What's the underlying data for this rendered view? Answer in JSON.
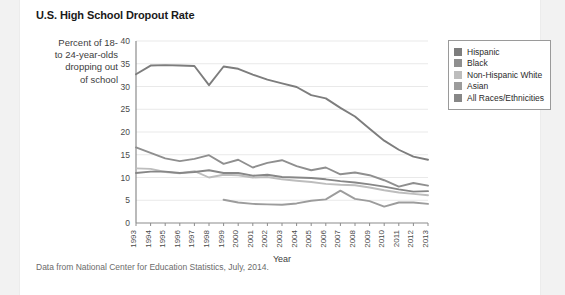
{
  "card": {
    "title": "U.S. High School Dropout Rate",
    "annotation": "Percent of 18- to 24-year-olds dropping out of school",
    "annotation_lines": [
      "Percent of 18-",
      "to 24-year-olds",
      "dropping out",
      "of school"
    ],
    "source": "Data from National Center for Education Statistics, July, 2014."
  },
  "legend": {
    "position": "top-right-inside",
    "items": [
      {
        "label": "Hispanic",
        "color": "#7d7d7d"
      },
      {
        "label": "Black",
        "color": "#8f8f8f"
      },
      {
        "label": "Non-Hispanic White",
        "color": "#bdbdbd"
      },
      {
        "label": "Asian",
        "color": "#9c9c9c"
      },
      {
        "label": "All Races/Ethnicities",
        "color": "#878787"
      }
    ]
  },
  "chart_data": {
    "type": "line",
    "title": "U.S. High School Dropout Rate",
    "subtitle": "Percent of 18- to 24-year-olds dropping out of school",
    "xlabel": "Year",
    "ylabel": "",
    "ylim": [
      0,
      40
    ],
    "yticks": [
      0,
      5,
      10,
      15,
      20,
      25,
      30,
      35,
      40
    ],
    "grid": true,
    "legend_position": "top-right",
    "annotation": "Data from National Center for Education Statistics, July, 2014.",
    "categories": [
      1993,
      1994,
      1995,
      1996,
      1997,
      1998,
      1999,
      2000,
      2001,
      2002,
      2003,
      2004,
      2005,
      2006,
      2007,
      2008,
      2009,
      2010,
      2011,
      2012,
      2013
    ],
    "x": [
      "1993",
      "1994",
      "1995",
      "1996",
      "1997",
      "1998",
      "1999",
      "2000",
      "2001",
      "2002",
      "2003",
      "2004",
      "2005",
      "2006",
      "2007",
      "2008",
      "2009",
      "2010",
      "2011",
      "2012",
      "2013"
    ],
    "series": [
      {
        "name": "Hispanic",
        "color": "#7d7d7d",
        "values": [
          32.7,
          34.6,
          34.7,
          34.6,
          34.5,
          30.3,
          34.4,
          33.9,
          32.6,
          31.5,
          30.7,
          29.9,
          28.1,
          27.4,
          25.3,
          23.4,
          20.7,
          18.1,
          16.1,
          14.6,
          13.9
        ]
      },
      {
        "name": "Black",
        "color": "#8f8f8f",
        "values": [
          16.6,
          15.4,
          14.2,
          13.6,
          14.1,
          14.9,
          13.0,
          13.9,
          12.2,
          13.2,
          13.8,
          12.5,
          11.6,
          12.2,
          10.7,
          11.1,
          10.5,
          9.4,
          8.0,
          8.8,
          8.2
        ]
      },
      {
        "name": "Non-Hispanic White",
        "color": "#bdbdbd",
        "values": [
          12.0,
          11.9,
          11.2,
          10.9,
          11.4,
          10.0,
          10.6,
          10.5,
          10.0,
          10.1,
          9.6,
          9.3,
          9.0,
          8.6,
          8.4,
          8.3,
          7.8,
          7.2,
          6.7,
          6.4,
          6.1
        ]
      },
      {
        "name": "Asian",
        "color": "#9c9c9c",
        "values": [
          null,
          null,
          null,
          null,
          null,
          null,
          5.1,
          4.5,
          4.2,
          4.1,
          4.0,
          4.3,
          4.9,
          5.2,
          7.1,
          5.3,
          4.8,
          3.6,
          4.5,
          4.5,
          4.2
        ]
      },
      {
        "name": "All Races/Ethnicities",
        "color": "#878787",
        "values": [
          11.0,
          11.3,
          11.3,
          11.0,
          11.2,
          11.6,
          11.0,
          11.0,
          10.4,
          10.6,
          10.1,
          10.0,
          9.9,
          9.6,
          9.2,
          8.9,
          8.5,
          8.0,
          7.4,
          6.9,
          7.0
        ]
      }
    ]
  },
  "axes": {
    "x_title": "Year",
    "y_tick_labels": [
      "40",
      "35",
      "30",
      "25",
      "20",
      "15",
      "10",
      "5",
      "0"
    ],
    "x_tick_labels": [
      "1993",
      "1994",
      "1995",
      "1996",
      "1997",
      "1998",
      "1999",
      "2000",
      "2001",
      "2002",
      "2003",
      "2004",
      "2005",
      "2006",
      "2007",
      "2008",
      "2009",
      "2010",
      "2011",
      "2012",
      "2013"
    ]
  }
}
